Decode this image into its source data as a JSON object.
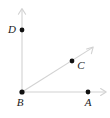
{
  "figure": {
    "type": "geometry-diagram",
    "width": 110,
    "height": 118,
    "background_color": "#ffffff",
    "line_color": "#d2d2d2",
    "point_color": "#111111",
    "label_color": "#1a1a1a"
  },
  "points": [
    {
      "id": "D",
      "label": "D",
      "x": 22,
      "y": 30,
      "label_x": 12,
      "label_y": 30,
      "on": "vertical-axis",
      "dot_radius": 2.4
    },
    {
      "id": "C",
      "label": "C",
      "x": 72,
      "y": 61,
      "label_x": 81,
      "label_y": 66,
      "on": "diagonal-ray",
      "dot_radius": 2.4
    },
    {
      "id": "B",
      "label": "B",
      "x": 22,
      "y": 92,
      "label_x": 20,
      "label_y": 103,
      "on": "origin",
      "dot_radius": 2.6
    },
    {
      "id": "A",
      "label": "A",
      "x": 88,
      "y": 92,
      "label_x": 88,
      "label_y": 103,
      "on": "horizontal-axis",
      "dot_radius": 2.4
    }
  ],
  "rays": [
    {
      "id": "vertical-axis",
      "name": "vertical-ray-BD",
      "from_x": 22,
      "from_y": 92,
      "to_x": 22,
      "to_y": 9,
      "arrow": true
    },
    {
      "id": "horizontal-axis",
      "name": "horizontal-ray-BA",
      "from_x": 22,
      "from_y": 92,
      "to_x": 106,
      "to_y": 92,
      "arrow": true
    },
    {
      "id": "diagonal-ray",
      "name": "diagonal-ray-BC",
      "from_x": 22,
      "from_y": 92,
      "to_x": 93,
      "to_y": 47,
      "arrow": true
    }
  ]
}
